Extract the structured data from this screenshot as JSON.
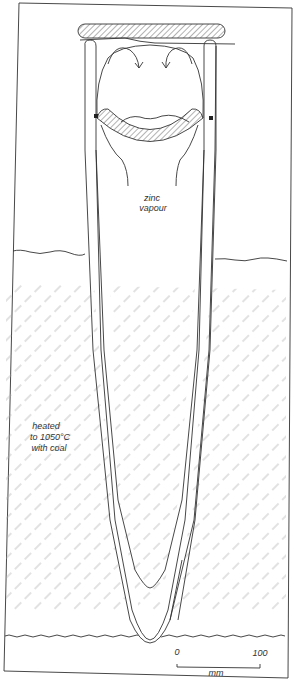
{
  "diagram": {
    "type": "cross-section",
    "labels": {
      "vapour_line1": "zinc",
      "vapour_line2": "vapour",
      "heat_line1": "heated",
      "heat_line2": "to 1050°C",
      "heat_line3": "with coal"
    },
    "scale_bar": {
      "start_label": "0",
      "end_label": "100",
      "unit": "mm"
    },
    "colors": {
      "line": "#333333",
      "hatch": "#9a9a9a",
      "background": "#ffffff"
    }
  }
}
